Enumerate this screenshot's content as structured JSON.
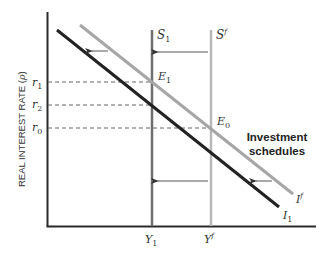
{
  "diagram": {
    "y_axis_label": "REAL INTEREST RATE (",
    "y_axis_label_symbol": "ρ",
    "y_axis_label_end": ")",
    "y_ticks": [
      {
        "base": "r",
        "sub": "1"
      },
      {
        "base": "r",
        "sub": "2"
      },
      {
        "base": "r",
        "sub": "0"
      }
    ],
    "x_ticks": [
      {
        "base": "Y",
        "sub": "1",
        "sup": ""
      },
      {
        "base": "Y",
        "sub": "",
        "sup": "f"
      }
    ],
    "curves": {
      "S1": {
        "base": "S",
        "sub": "1",
        "sup": ""
      },
      "Sf": {
        "base": "S",
        "sub": "",
        "sup": "f"
      },
      "If": {
        "base": "I",
        "sub": "",
        "sup": "f"
      },
      "I1": {
        "base": "I",
        "sub": "1",
        "sup": ""
      }
    },
    "points": {
      "E1": {
        "base": "E",
        "sub": "1"
      },
      "E0": {
        "base": "E",
        "sub": "0"
      }
    },
    "annotation_line1": "Investment",
    "annotation_line2": "schedules",
    "colors": {
      "axis": "#2b2b2b",
      "I1": "#222222",
      "If": "#a6a6a6",
      "S1": "#6f6f6f",
      "Sf": "#b8b8b8",
      "dashed": "#666666",
      "arrow": "#555555"
    }
  }
}
